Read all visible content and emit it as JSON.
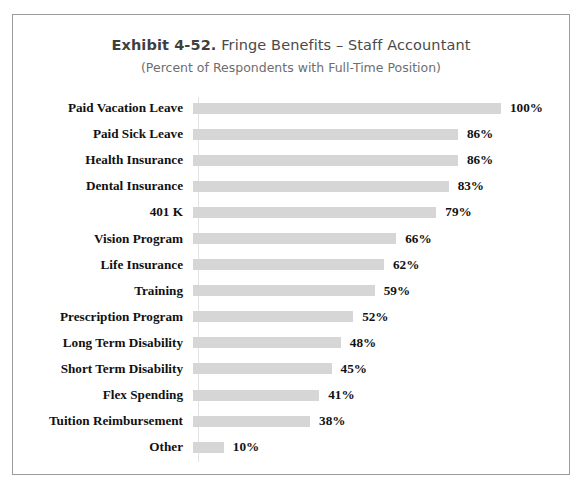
{
  "chart_data": {
    "type": "bar",
    "orientation": "horizontal",
    "title": "Exhibit 4-52.  Fringe Benefits – Staff Accountant",
    "title_strong": "Exhibit 4-52.",
    "title_rest": "Fringe Benefits – Staff Accountant",
    "subtitle": "(Percent of Respondents with Full-Time Position)",
    "xlabel": "",
    "ylabel": "",
    "xlim": [
      0,
      100
    ],
    "grid": false,
    "legend": false,
    "value_suffix": "%",
    "bar_color": "#d6d6d6",
    "categories": [
      "Paid Vacation Leave",
      "Paid Sick Leave",
      "Health Insurance",
      "Dental Insurance",
      "401 K",
      "Vision Program",
      "Life Insurance",
      "Training",
      "Prescription Program",
      "Long Term Disability",
      "Short Term Disability",
      "Flex Spending",
      "Tuition Reimbursement",
      "Other"
    ],
    "values": [
      100,
      86,
      86,
      83,
      79,
      66,
      62,
      59,
      52,
      48,
      45,
      41,
      38,
      10
    ],
    "value_labels": [
      "100%",
      "86%",
      "86%",
      "83%",
      "79%",
      "66%",
      "62%",
      "59%",
      "52%",
      "48%",
      "45%",
      "41%",
      "38%",
      "10%"
    ]
  }
}
